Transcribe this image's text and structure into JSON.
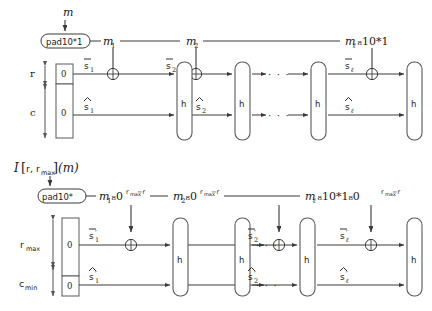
{
  "figure": {
    "title_top_input": "m",
    "title_bottom_input": "I[r, r",
    "type": "sponge-construction-diagram"
  },
  "top_row": {
    "input_label": "m",
    "pad_label": "pad10*1",
    "message_blocks": [
      "m₁",
      "m₂",
      "mℓ‖10*1"
    ],
    "message_block_1": "m",
    "message_block_1_sub": "1",
    "message_block_2": "m",
    "message_block_2_sub": "2",
    "message_block_last_pre": "m",
    "message_block_last_sub": "ℓ",
    "message_block_last_post": "₈10*1",
    "rate_label": "r",
    "capacity_label": "c",
    "init_rate_value": "0",
    "init_cap_value": "0",
    "state_top_1": "s",
    "state_top_1_sub": "1",
    "state_top_2": "s",
    "state_top_2_sub": "2",
    "state_top_last": "s",
    "state_top_last_sub": "ℓ",
    "state_bot_1": "s",
    "state_bot_1_sub": "1",
    "state_bot_2": "s",
    "state_bot_2_sub": "2",
    "state_bot_last": "s",
    "state_bot_last_sub": "ℓ",
    "permutation_label": "h",
    "ellipsis": "· · ·",
    "xor_symbol": "⊕"
  },
  "bottom_row": {
    "input_label_pre": "I",
    "input_label_bracket_open": "[",
    "input_label_r": "r,",
    "input_label_rmax": "r",
    "input_label_rmax_sub": "max",
    "input_label_bracket_close": "]",
    "input_label_m": "(m)",
    "pad_label": "pad10*",
    "message_block_1": "m",
    "message_block_1_sub": "1",
    "message_block_1_tail": "₈0",
    "message_block_1_exp": "r",
    "message_block_1_exp_sub": "max",
    "message_block_1_exp_tail": "−r",
    "message_block_2": "m",
    "message_block_2_sub": "2",
    "message_block_last": "m",
    "message_block_last_sub": "ℓ",
    "message_block_last_mid": "₈10*1₈0",
    "rate_label": "r",
    "rate_label_sub": "max",
    "capacity_label": "c",
    "capacity_label_sub": "min",
    "init_rate_value": "0",
    "init_cap_value": "0",
    "state_top_1": "s",
    "state_top_1_sub": "1",
    "state_top_2": "s",
    "state_top_2_sub": "2",
    "state_top_last": "s",
    "state_top_last_sub": "ℓ",
    "state_bot_1": "s",
    "state_bot_1_sub": "1",
    "state_bot_2": "s",
    "state_bot_2_sub": "2",
    "state_bot_last": "s",
    "state_bot_last_sub": "ℓ",
    "prime": "′",
    "permutation_label": "h",
    "ellipsis": "· · ·",
    "xor_symbol": "⊕"
  },
  "colors": {
    "line": "#3a3a3a",
    "text": "#1a1a1a",
    "background": "#ffffff"
  }
}
